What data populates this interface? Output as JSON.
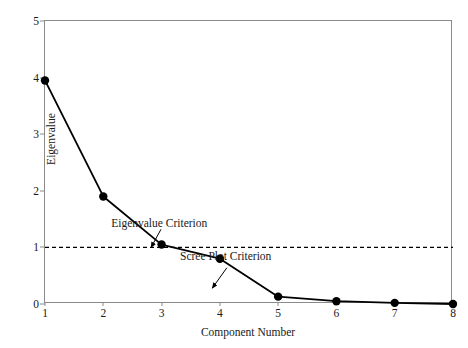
{
  "chart_data": {
    "type": "line",
    "title": "",
    "xlabel": "Component Number",
    "ylabel": "Eigenvalue",
    "x": [
      1,
      2,
      3,
      4,
      5,
      6,
      7,
      8
    ],
    "values": [
      3.95,
      1.9,
      1.05,
      0.8,
      0.13,
      0.05,
      0.02,
      0.0
    ],
    "series": [
      {
        "name": "Eigenvalue",
        "values": [
          3.95,
          1.9,
          1.05,
          0.8,
          0.13,
          0.05,
          0.02,
          0.0
        ]
      }
    ],
    "xlim": [
      1,
      8
    ],
    "ylim": [
      0,
      5
    ],
    "xticks": [
      "1",
      "2",
      "3",
      "4",
      "5",
      "6",
      "7",
      "8"
    ],
    "yticks": [
      "0",
      "1",
      "2",
      "3",
      "4",
      "5"
    ],
    "grid": false,
    "legend": "none",
    "reference_lines": [
      {
        "name": "eigenvalue-one-line",
        "y": 1,
        "style": "dashed",
        "color": "#000000"
      }
    ],
    "annotations": [
      {
        "name": "eigenvalue-criterion",
        "text": "Eigenvalue Criterion",
        "text_x": 2.96,
        "text_y": 1.36,
        "arrow_from_x": 2.99,
        "arrow_from_y": 1.32,
        "arrow_to_x": 2.82,
        "arrow_to_y": 1.0
      },
      {
        "name": "scree-plot-criterion",
        "text": "Scree Plot Criterion",
        "text_x": 4.1,
        "text_y": 0.77,
        "arrow_from_x": 4.12,
        "arrow_from_y": 0.64,
        "arrow_to_x": 3.87,
        "arrow_to_y": 0.28
      }
    ],
    "colors": {
      "line": "#000000",
      "marker": "#000000",
      "axis": "#8a8a8a",
      "text": "#1a1a1a",
      "background": "#ffffff"
    }
  }
}
